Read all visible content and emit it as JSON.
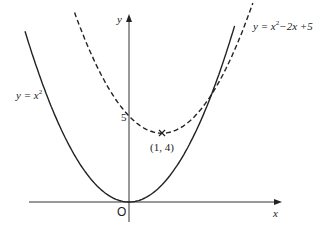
{
  "diagram": {
    "type": "function-graph",
    "axes": {
      "x_label": "x",
      "y_label": "y",
      "origin_label": "O"
    },
    "curves": [
      {
        "name": "parabola",
        "label": "y = x²",
        "style": "solid",
        "equation": "y=x^2"
      },
      {
        "name": "shifted-parabola",
        "label": "y = x²−2x+5",
        "style": "dashed",
        "equation": "y=x^2-2x+5"
      }
    ],
    "points": [
      {
        "label": "(1,4)",
        "x": 1,
        "y": 4,
        "marker": "x"
      }
    ],
    "y_intercept_label": "5"
  },
  "labels": {
    "y_axis": "y",
    "x_axis": "x",
    "origin": "O",
    "five": "5",
    "vertex": "(1, 4)",
    "curve1_y": "y",
    "curve1_eq": " = x",
    "curve1_sup": "2",
    "curve2_y": "y",
    "curve2_eq": " = x",
    "curve2_sup": "2",
    "curve2_rest": "−2x +5"
  }
}
